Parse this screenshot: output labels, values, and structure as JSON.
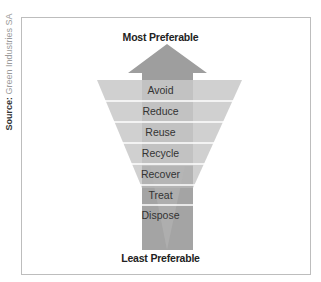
{
  "source": {
    "label": "Source:",
    "text": "Green Industries SA"
  },
  "diagram": {
    "top_label": "Most Preferable",
    "bottom_label": "Least Preferable",
    "levels": [
      "Avoid",
      "Reduce",
      "Reuse",
      "Recycle",
      "Recover",
      "Treat",
      "Dispose"
    ]
  },
  "colors": {
    "arrow": "#9c9c9c",
    "funnel": "#c4c4c4",
    "separator": "#ffffff",
    "frame": "#bdbdbd"
  }
}
